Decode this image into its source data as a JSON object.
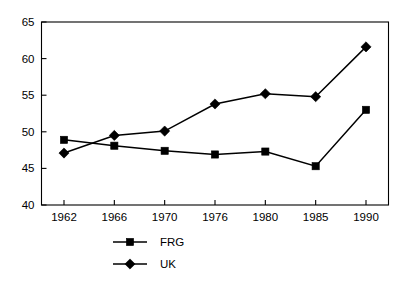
{
  "chart_data": {
    "type": "line",
    "title": "",
    "xlabel": "",
    "ylabel": "",
    "categories": [
      "1962",
      "1966",
      "1970",
      "1976",
      "1980",
      "1985",
      "1990"
    ],
    "ylim": [
      40,
      65
    ],
    "yticks": [
      40,
      45,
      50,
      55,
      60,
      65
    ],
    "ytick_labels": [
      "40",
      "45",
      "50",
      "55",
      "60",
      "65"
    ],
    "grid": false,
    "legend_position": "below-plot-left",
    "frame": "box",
    "series": [
      {
        "name": "FRG",
        "marker": "square",
        "color": "#000000",
        "values": [
          48.9,
          48.1,
          47.4,
          46.9,
          47.3,
          45.3,
          53.0
        ]
      },
      {
        "name": "UK",
        "marker": "diamond",
        "color": "#000000",
        "values": [
          47.1,
          49.5,
          50.1,
          53.8,
          55.2,
          54.8,
          61.6
        ]
      }
    ]
  },
  "legend": {
    "entries": [
      {
        "label": "FRG",
        "marker": "square"
      },
      {
        "label": "UK",
        "marker": "diamond"
      }
    ]
  }
}
